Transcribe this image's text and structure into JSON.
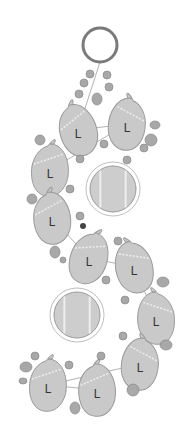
{
  "diagram": {
    "colors": {
      "background": "#ffffff",
      "ring": "#7a7a7a",
      "leaf_fill": "#c9c9c9",
      "leaf_stroke": "#9a9a9a",
      "disc_fill": "#cdcdcd",
      "bead_fill": "#a8a8a8",
      "bead_stroke": "#888888",
      "dark_bead": "#444444",
      "thread": "#a0a0a0",
      "label": "#333333"
    },
    "ring": {
      "cx": 100,
      "cy": 45,
      "r": 17
    },
    "leaves": [
      {
        "id": 1,
        "label": "L",
        "x": 78,
        "y": 130,
        "rot": -20,
        "flip": false
      },
      {
        "id": 2,
        "label": "L",
        "x": 127,
        "y": 124,
        "rot": 10,
        "flip": true
      },
      {
        "id": 3,
        "label": "L",
        "x": 50,
        "y": 170,
        "rot": 0,
        "flip": false
      },
      {
        "id": 4,
        "label": "L",
        "x": 52,
        "y": 218,
        "rot": -10,
        "flip": false
      },
      {
        "id": 5,
        "label": "L",
        "x": 89,
        "y": 258,
        "rot": 15,
        "flip": false
      },
      {
        "id": 6,
        "label": "L",
        "x": 134,
        "y": 267,
        "rot": -10,
        "flip": true
      },
      {
        "id": 7,
        "label": "L",
        "x": 156,
        "y": 318,
        "rot": 0,
        "flip": true
      },
      {
        "id": 8,
        "label": "L",
        "x": 140,
        "y": 364,
        "rot": 10,
        "flip": true
      },
      {
        "id": 9,
        "label": "L",
        "x": 48,
        "y": 385,
        "rot": 0,
        "flip": false
      },
      {
        "id": 10,
        "label": "L",
        "x": 97,
        "y": 390,
        "rot": -5,
        "flip": false
      }
    ],
    "discs": [
      {
        "cx": 113,
        "cy": 189,
        "r": 23
      },
      {
        "cx": 77,
        "cy": 315,
        "r": 23
      }
    ],
    "beads": [
      {
        "cx": 90,
        "cy": 74,
        "rx": 4,
        "ry": 4
      },
      {
        "cx": 107,
        "cy": 75,
        "rx": 4,
        "ry": 4
      },
      {
        "cx": 84,
        "cy": 83,
        "rx": 4,
        "ry": 4
      },
      {
        "cx": 109,
        "cy": 87,
        "rx": 4,
        "ry": 4
      },
      {
        "cx": 79,
        "cy": 94,
        "rx": 4,
        "ry": 4
      },
      {
        "cx": 97,
        "cy": 99,
        "rx": 5,
        "ry": 6
      },
      {
        "cx": 40,
        "cy": 140,
        "rx": 5,
        "ry": 5
      },
      {
        "cx": 155,
        "cy": 125,
        "rx": 5,
        "ry": 4
      },
      {
        "cx": 151,
        "cy": 140,
        "rx": 6,
        "ry": 6
      },
      {
        "cx": 144,
        "cy": 148,
        "rx": 4,
        "ry": 4
      },
      {
        "cx": 104,
        "cy": 144,
        "rx": 4,
        "ry": 4
      },
      {
        "cx": 80,
        "cy": 159,
        "rx": 4,
        "ry": 4
      },
      {
        "cx": 127,
        "cy": 160,
        "rx": 4,
        "ry": 4
      },
      {
        "cx": 70,
        "cy": 189,
        "rx": 4,
        "ry": 4
      },
      {
        "cx": 32,
        "cy": 199,
        "rx": 5,
        "ry": 5
      },
      {
        "cx": 80,
        "cy": 216,
        "rx": 4,
        "ry": 4
      },
      {
        "cx": 55,
        "cy": 252,
        "rx": 5,
        "ry": 6
      },
      {
        "cx": 63,
        "cy": 260,
        "rx": 3,
        "ry": 3
      },
      {
        "cx": 118,
        "cy": 241,
        "rx": 4,
        "ry": 4
      },
      {
        "cx": 106,
        "cy": 280,
        "rx": 4,
        "ry": 4
      },
      {
        "cx": 163,
        "cy": 282,
        "rx": 6,
        "ry": 5
      },
      {
        "cx": 125,
        "cy": 300,
        "rx": 4,
        "ry": 4
      },
      {
        "cx": 123,
        "cy": 336,
        "rx": 4,
        "ry": 4
      },
      {
        "cx": 166,
        "cy": 345,
        "rx": 6,
        "ry": 5
      },
      {
        "cx": 35,
        "cy": 356,
        "rx": 4,
        "ry": 4
      },
      {
        "cx": 26,
        "cy": 367,
        "rx": 6,
        "ry": 5
      },
      {
        "cx": 23,
        "cy": 381,
        "rx": 4,
        "ry": 3
      },
      {
        "cx": 69,
        "cy": 365,
        "rx": 4,
        "ry": 4
      },
      {
        "cx": 101,
        "cy": 356,
        "rx": 4,
        "ry": 4
      },
      {
        "cx": 133,
        "cy": 390,
        "rx": 6,
        "ry": 6
      },
      {
        "cx": 75,
        "cy": 408,
        "rx": 5,
        "ry": 6
      }
    ],
    "dark_beads": [
      {
        "cx": 83,
        "cy": 226,
        "r": 3
      }
    ]
  }
}
